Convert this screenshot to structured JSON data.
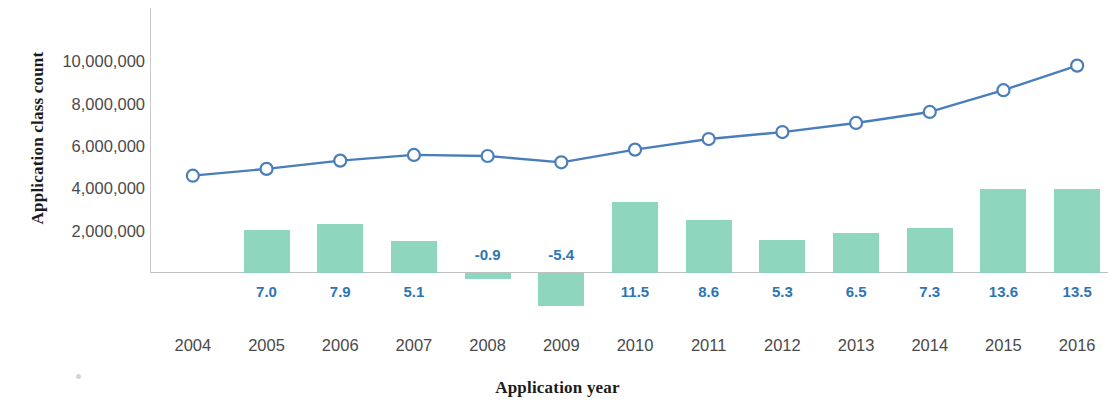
{
  "chart_data": {
    "type": "bar",
    "title": "",
    "xlabel": "Application  year",
    "ylabel": "Application class count",
    "categories": [
      "2004",
      "2005",
      "2006",
      "2007",
      "2008",
      "2009",
      "2010",
      "2011",
      "2012",
      "2013",
      "2014",
      "2015",
      "2016"
    ],
    "y_ticks": [
      "2,000,000",
      "4,000,000",
      "6,000,000",
      "8,000,000",
      "10,000,000"
    ],
    "y_tick_values": [
      2000000,
      4000000,
      6000000,
      8000000,
      10000000
    ],
    "ylim": [
      0,
      11200000
    ],
    "grid": false,
    "legend": "none",
    "series": [
      {
        "name": "Application class count",
        "type": "line",
        "marker": "open-circle",
        "color": "#4a7ebb",
        "axis": "left",
        "values": [
          4600000,
          4920000,
          5310000,
          5580000,
          5530000,
          5230000,
          5830000,
          6330000,
          6660000,
          7090000,
          7610000,
          8640000,
          9800000
        ]
      },
      {
        "name": "Annual growth rate (%)",
        "type": "bar",
        "color": "#86d3b8",
        "axis": "secondary",
        "values": [
          null,
          7.0,
          7.9,
          5.1,
          -0.9,
          -5.4,
          11.5,
          8.6,
          5.3,
          6.5,
          7.3,
          13.6,
          13.5
        ],
        "labels": [
          "",
          "7.0",
          "7.9",
          "5.1",
          "-0.9",
          "-5.4",
          "11.5",
          "8.6",
          "5.3",
          "6.5",
          "7.3",
          "13.6",
          "13.5"
        ]
      }
    ]
  },
  "colors": {
    "line": "#4a7ebb",
    "bar": "#86d3b8",
    "label": "#2e75b6",
    "tick_text": "#4a4a4a",
    "axis_title": "#1b1b1b",
    "axis_line": "#c0bfbf"
  }
}
